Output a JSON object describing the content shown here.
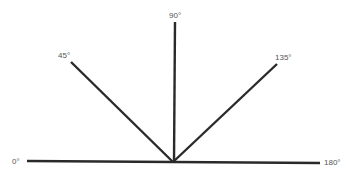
{
  "diagram": {
    "title": "",
    "type": "angles",
    "vertex": [
      173,
      162
    ],
    "rays": [
      {
        "label": "0°",
        "angle": 0
      },
      {
        "label": "45°",
        "angle": 45
      },
      {
        "label": "90°",
        "angle": 90
      },
      {
        "label": "135°",
        "angle": 135
      },
      {
        "label": "180°",
        "angle": 180
      }
    ]
  }
}
